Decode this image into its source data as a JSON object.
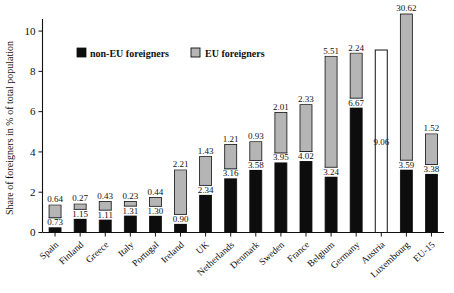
{
  "chart_data": {
    "type": "bar",
    "title": "",
    "subtitle": "",
    "xlabel": "",
    "ylabel": "Share of foreigners in % of total population",
    "ylim": [
      0,
      10.6
    ],
    "yticks": [
      0,
      2,
      4,
      6,
      8,
      10
    ],
    "ytick_labels": [
      "0",
      "2",
      "4",
      "6",
      "8",
      "10"
    ],
    "grid": false,
    "stacked": true,
    "legend_position": "inside-top-left",
    "categories": [
      "Spain",
      "Finland",
      "Greece",
      "Italy",
      "Portugal",
      "Ireland",
      "UK",
      "Netherlands",
      "Denmark",
      "Sweden",
      "France",
      "Belgium",
      "Germany",
      "Austria",
      "Luxembourg",
      "EU-15"
    ],
    "series": [
      {
        "name": "non-EU foreigners",
        "color": "#0d0d0d",
        "values": [
          0.73,
          1.15,
          1.11,
          1.31,
          1.3,
          0.9,
          2.34,
          3.16,
          3.58,
          3.95,
          4.02,
          3.24,
          6.67,
          null,
          3.59,
          3.38
        ],
        "labels": [
          "0.73",
          "1.15",
          "1.11",
          "1.31",
          "1.30",
          "0.90",
          "2.34",
          "3.16",
          "3.58",
          "3.95",
          "4.02",
          "3.24",
          "6.67",
          "",
          "3.59",
          "3.38"
        ]
      },
      {
        "name": "EU foreigners",
        "color": "#b5b5b5",
        "values": [
          0.64,
          0.27,
          0.43,
          0.23,
          0.44,
          2.21,
          1.43,
          1.21,
          0.93,
          2.01,
          2.33,
          5.51,
          2.24,
          null,
          30.62,
          1.52
        ],
        "labels": [
          "0.64",
          "0.27",
          "0.43",
          "0.23",
          "0.44",
          "2.21",
          "1.43",
          "1.21",
          "0.93",
          "2.01",
          "2.33",
          "5.51",
          "2.24",
          "",
          "30.62",
          "1.52"
        ]
      },
      {
        "name": "total foreigners",
        "color": "#ffffff",
        "values": [
          null,
          null,
          null,
          null,
          null,
          null,
          null,
          null,
          null,
          null,
          null,
          null,
          null,
          9.06,
          null,
          null
        ],
        "labels": [
          "",
          "",
          "",
          "",
          "",
          "",
          "",
          "",
          "",
          "",
          "",
          "",
          "",
          "9.06",
          "",
          ""
        ]
      }
    ]
  },
  "legend": {
    "items": [
      {
        "label": "non-EU foreigners",
        "swatch": "#0d0d0d",
        "name": "legend-swatch-non-eu"
      },
      {
        "label": "EU foreigners",
        "swatch": "#b5b5b5",
        "name": "legend-swatch-eu"
      }
    ]
  }
}
